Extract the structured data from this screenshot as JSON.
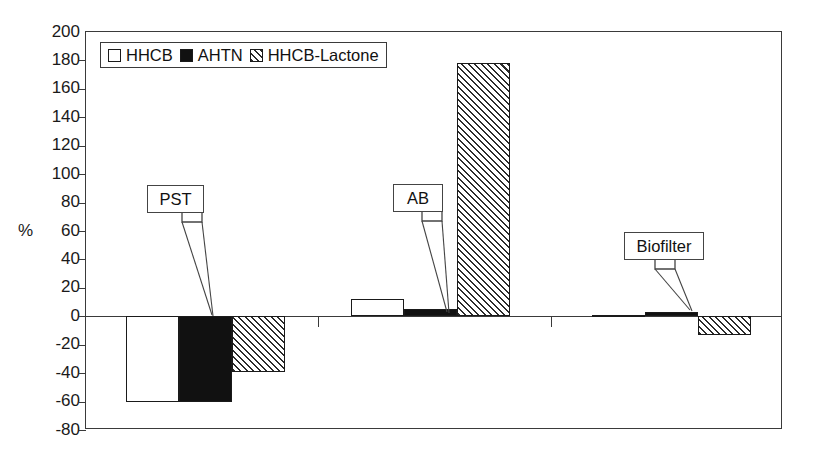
{
  "axis": {
    "ylabel": "%",
    "yticks": [
      "200",
      "180",
      "160",
      "140",
      "120",
      "100",
      "80",
      "60",
      "40",
      "20",
      "0",
      "-20",
      "-40",
      "-60",
      "-80"
    ]
  },
  "legend": {
    "items": [
      {
        "label": "HHCB",
        "pattern": "open",
        "swatch_icon": "open-square-swatch"
      },
      {
        "label": "AHTN",
        "pattern": "solid",
        "swatch_icon": "solid-square-swatch"
      },
      {
        "label": "HHCB-Lactone",
        "pattern": "hatch",
        "swatch_icon": "hatched-square-swatch"
      }
    ]
  },
  "callouts": [
    {
      "label": "PST"
    },
    {
      "label": "AB"
    },
    {
      "label": "Biofilter"
    }
  ],
  "chart_data": {
    "type": "bar",
    "title": "",
    "xlabel": "",
    "ylabel": "%",
    "categories": [
      "PST",
      "AB",
      "Biofilter"
    ],
    "series": [
      {
        "name": "HHCB",
        "pattern": "open",
        "values": [
          -60,
          12,
          1
        ]
      },
      {
        "name": "AHTN",
        "pattern": "solid",
        "values": [
          -60,
          5,
          3
        ]
      },
      {
        "name": "HHCB-Lactone",
        "pattern": "hatch",
        "values": [
          -39,
          178,
          -13
        ]
      }
    ],
    "ylim": [
      -80,
      200
    ],
    "ytick_step": 20,
    "grid": false,
    "legend_position": "top-left",
    "xtick_labels_shown": false,
    "zero_line": true
  }
}
